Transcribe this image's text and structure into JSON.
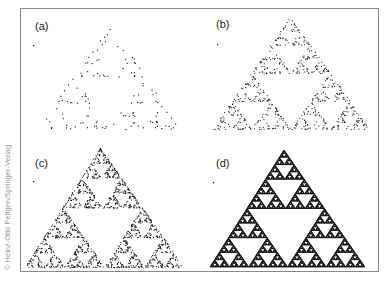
{
  "figure": {
    "credit": "© Heinz-Otto Peitgen/Springer-Verlag",
    "colors": {
      "ink": "#111111",
      "frame": "#8a8a8a",
      "credit": "#9a9a9a",
      "background": "#ffffff"
    },
    "panels": [
      {
        "id": "a",
        "label": "(a)",
        "kind": "chaos-game",
        "points": 130,
        "dot": 1.1,
        "label_pos": [
          35,
          30
        ],
        "apex": [
          112,
          24
        ],
        "left": [
          36,
          129
        ],
        "right": [
          180,
          129
        ],
        "stray": [
          33,
          45
        ]
      },
      {
        "id": "b",
        "label": "(b)",
        "kind": "chaos-game",
        "points": 650,
        "dot": 1.0,
        "label_pos": [
          216,
          28
        ],
        "apex": [
          290,
          17
        ],
        "left": [
          212,
          129
        ],
        "right": [
          370,
          129
        ],
        "stray": [
          217,
          44
        ]
      },
      {
        "id": "c",
        "label": "(c)",
        "kind": "chaos-game",
        "points": 1500,
        "dot": 1.0,
        "label_pos": [
          35,
          167
        ],
        "apex": [
          100,
          148
        ],
        "left": [
          25,
          267
        ],
        "right": [
          184,
          267
        ],
        "stray": [
          33,
          181
        ]
      },
      {
        "id": "d",
        "label": "(d)",
        "kind": "gasket",
        "depth": 6,
        "label_pos": [
          216,
          167
        ],
        "apex": [
          284,
          150
        ],
        "left": [
          210,
          267
        ],
        "right": [
          365,
          267
        ],
        "stray": [
          213,
          182
        ]
      }
    ]
  }
}
